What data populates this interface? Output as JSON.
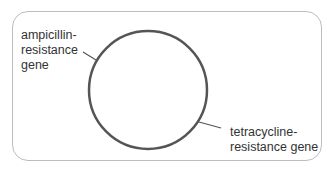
{
  "diagram": {
    "type": "plasmid-map",
    "labels": {
      "ampicillin": [
        "ampicillin-",
        "resistance",
        "gene"
      ],
      "tetracycline": [
        "tetracycline-",
        "resistance gene"
      ]
    },
    "colors": {
      "circle": "#555555",
      "frame": "#bdbdbd",
      "text": "#333333"
    }
  }
}
